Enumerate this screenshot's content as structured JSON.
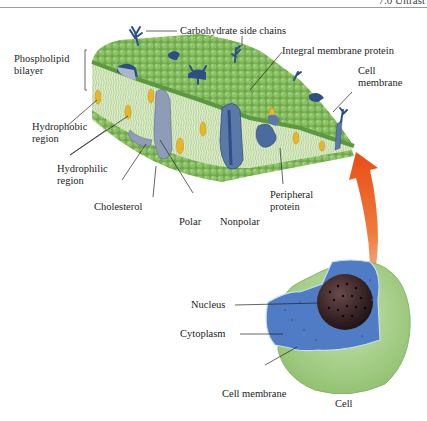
{
  "header": {
    "text": "7.0 Ultrast"
  },
  "membrane_labels": {
    "carbohydrate": "Carbohydrate side chains",
    "phospholipid_1": "Phospholipid",
    "phospholipid_2": "bilayer",
    "integral": "Integral membrane protein",
    "cell_membrane_1": "Cell",
    "cell_membrane_2": "membrane",
    "hydrophobic_1": "Hydrophobic",
    "hydrophobic_2": "region",
    "hydrophilic_1": "Hydrophilic",
    "hydrophilic_2": "region",
    "cholesterol": "Cholesterol",
    "polar": "Polar",
    "nonpolar": "Nonpolar",
    "peripheral_1": "Peripheral",
    "peripheral_2": "protein"
  },
  "cell_labels": {
    "nucleus": "Nucleus",
    "cytoplasm": "Cytoplasm",
    "cell_membrane": "Cell membrane",
    "cell": "Cell"
  },
  "colors": {
    "lipid_head": "#7fb55a",
    "lipid_tail": "#d9e9c4",
    "protein": "#5b78a8",
    "protein_dark": "#2e4f86",
    "cholesterol": "#e8b62a",
    "arrow": "#e8521c",
    "cytoplasm": "#4f7cc4",
    "nucleus": "#3a2526",
    "cell_outer": "#a9cf8a"
  }
}
